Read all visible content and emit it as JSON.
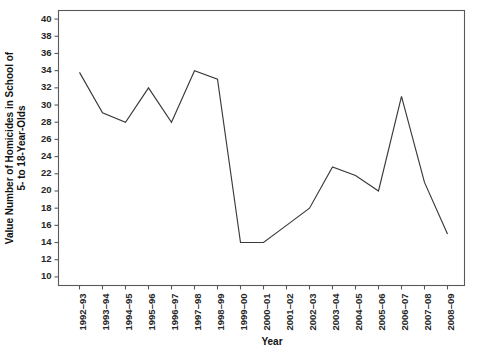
{
  "chart_data": {
    "type": "line",
    "title": "",
    "xlabel": "Year",
    "ylabel": "Value Number of Homicides in School of 5- to 18-Year-Olds",
    "ylabel_line1": "Value Number of Homicides in School of",
    "ylabel_line2": "5- to 18-Year-Olds",
    "categories": [
      "1992–93",
      "1993–94",
      "1994–95",
      "1995–96",
      "1996–97",
      "1997–98",
      "1998–99",
      "1999–00",
      "2000–01",
      "2001–02",
      "2002–03",
      "2003–04",
      "2004–05",
      "2005–06",
      "2006–07",
      "2007–08",
      "2008–09"
    ],
    "values": [
      33.8,
      29.1,
      28.0,
      32.0,
      28.0,
      34.0,
      33.0,
      14.0,
      14.0,
      16.0,
      18.0,
      22.8,
      21.8,
      20.0,
      31.0,
      21.0,
      15.0
    ],
    "ylim": [
      9,
      41
    ],
    "yticks": [
      10,
      12,
      14,
      16,
      18,
      20,
      22,
      24,
      26,
      28,
      30,
      32,
      34,
      36,
      38,
      40
    ],
    "ytick_labels": [
      "10",
      "12",
      "14",
      "16",
      "18",
      "20",
      "22",
      "24",
      "26",
      "28",
      "30",
      "32",
      "34",
      "36",
      "38",
      "40"
    ],
    "grid": false,
    "legend": null,
    "legend_position": "none",
    "line_color": "#3a3a3a",
    "axis_color": "#595959",
    "background_color": "#ffffff"
  }
}
